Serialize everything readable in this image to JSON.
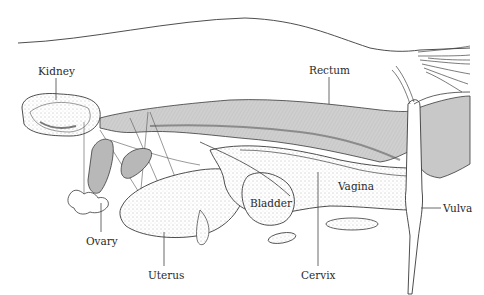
{
  "diagram": {
    "colors": {
      "line": "#3a3a3a",
      "shade": "#c8c8c8",
      "dark_shade": "#6a6a6a",
      "background": "#ffffff",
      "label_text": "#2a2a2a"
    },
    "labels": [
      {
        "id": "kidney",
        "text": "Kidney",
        "x": 38,
        "y": 66
      },
      {
        "id": "rectum",
        "text": "Rectum",
        "x": 309,
        "y": 65
      },
      {
        "id": "bladder",
        "text": "Bladder",
        "x": 250,
        "y": 198
      },
      {
        "id": "vagina",
        "text": "Vagina",
        "x": 338,
        "y": 181
      },
      {
        "id": "vulva",
        "text": "Vulva",
        "x": 443,
        "y": 205
      },
      {
        "id": "ovary",
        "text": "Ovary",
        "x": 86,
        "y": 236
      },
      {
        "id": "uterus",
        "text": "Uterus",
        "x": 148,
        "y": 270
      },
      {
        "id": "cervix",
        "text": "Cervix",
        "x": 301,
        "y": 270
      }
    ]
  }
}
